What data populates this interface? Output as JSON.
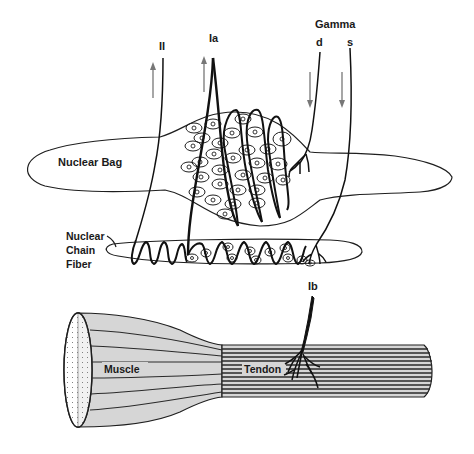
{
  "diagram": {
    "labels": {
      "afferent_II": "II",
      "afferent_Ia": "Ia",
      "gamma": "Gamma",
      "gamma_d": "d",
      "gamma_s": "s",
      "nuclear_bag": "Nuclear Bag",
      "nuclear_chain_line1": "Nuclear",
      "nuclear_chain_line2": "Chain",
      "nuclear_chain_line3": "Fiber",
      "afferent_Ib": "Ib",
      "muscle": "Muscle",
      "tendon": "Tendon"
    },
    "arrows": [
      {
        "id": "II",
        "direction": "up"
      },
      {
        "id": "Ia",
        "direction": "up"
      },
      {
        "id": "gamma_d",
        "direction": "down"
      },
      {
        "id": "gamma_s",
        "direction": "down"
      }
    ],
    "colors": {
      "line": "#111111",
      "arrow": "#777777",
      "muscle_fill": "#d6d6d6",
      "background": "#ffffff"
    }
  }
}
